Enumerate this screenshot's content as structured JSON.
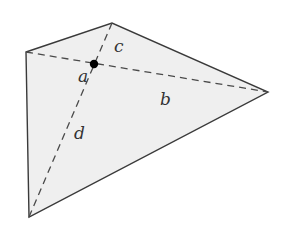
{
  "diagram": {
    "type": "quadrilateral-with-diagonals",
    "colors": {
      "fill": "#efefef",
      "stroke": "#3a3a3a",
      "dashed": "#4a4a4a",
      "point": "#000000",
      "label": "#333333"
    },
    "vertices": {
      "A": [
        26,
        52
      ],
      "B": [
        112,
        23
      ],
      "C": [
        268,
        92
      ],
      "D": [
        29,
        217
      ]
    },
    "intersection": [
      94,
      64
    ],
    "segments": [
      {
        "name": "a",
        "from": "intersection",
        "to": "A"
      },
      {
        "name": "b",
        "from": "intersection",
        "to": "C"
      },
      {
        "name": "c",
        "from": "intersection",
        "to": "B"
      },
      {
        "name": "d",
        "from": "intersection",
        "to": "D"
      }
    ],
    "labels": {
      "a": {
        "text": "a",
        "x": 78,
        "y": 82
      },
      "b": {
        "text": "b",
        "x": 160,
        "y": 105
      },
      "c": {
        "text": "c",
        "x": 114,
        "y": 52
      },
      "d": {
        "text": "d",
        "x": 74,
        "y": 139
      }
    }
  }
}
